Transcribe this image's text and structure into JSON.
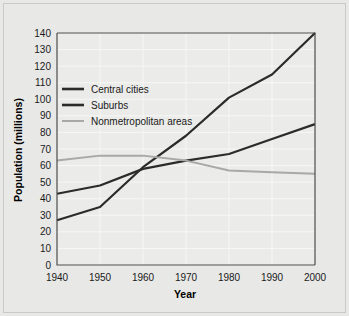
{
  "chart_data": {
    "type": "line",
    "title": "",
    "xlabel": "Year",
    "ylabel": "Population (millions)",
    "x": [
      1940,
      1950,
      1960,
      1970,
      1980,
      1990,
      2000
    ],
    "xlim": [
      1940,
      2000
    ],
    "ylim": [
      0,
      140
    ],
    "xticks": [
      "1940",
      "1950",
      "1960",
      "1970",
      "1980",
      "1990",
      "2000"
    ],
    "yticks": [
      "0",
      "10",
      "20",
      "30",
      "40",
      "50",
      "60",
      "70",
      "80",
      "90",
      "100",
      "110",
      "120",
      "130",
      "140"
    ],
    "grid": true,
    "legend_position": "upper-left",
    "series": [
      {
        "name": "Central cities",
        "color": "#2b2b2b",
        "values": [
          43,
          48,
          58,
          63,
          67,
          76,
          85
        ]
      },
      {
        "name": "Suburbs",
        "color": "#2b2b2b",
        "values": [
          27,
          35,
          59,
          78,
          101,
          115,
          140
        ]
      },
      {
        "name": "Nonmetropolitan areas",
        "color": "#a8a8a8",
        "values": [
          63,
          66,
          66,
          63,
          57,
          56,
          55
        ]
      }
    ]
  },
  "legend": {
    "items": [
      {
        "label": "Central cities"
      },
      {
        "label": "Suburbs"
      },
      {
        "label": "Nonmetropolitan areas"
      }
    ]
  },
  "axes": {
    "x_title": "Year",
    "y_title": "Population (millions)"
  }
}
